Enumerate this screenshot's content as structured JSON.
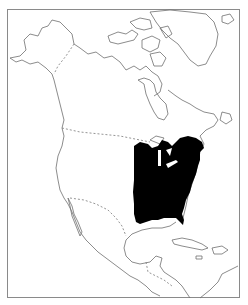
{
  "map": {
    "region": "North America",
    "style": "black-and-white outline range map",
    "highlighted_range": "Eastern United States and southeastern Canada",
    "colors": {
      "background": "#ffffff",
      "outline": "#6e6e6e",
      "range_fill": "#000000",
      "frame": "#8a8a8a"
    },
    "borders": [
      "Alaska–Canada (dashed)",
      "Canada–United States (dashed)",
      "United States–Mexico (dashed)"
    ]
  }
}
